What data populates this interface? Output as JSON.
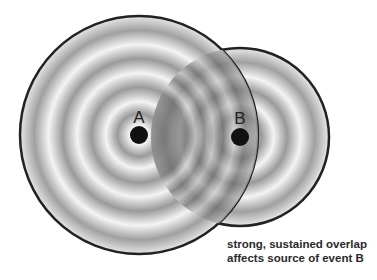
{
  "diagram": {
    "sources": [
      {
        "label": "A",
        "cx": 139,
        "cy": 135,
        "r": 119,
        "dot_r": 9
      },
      {
        "label": "B",
        "cx": 240,
        "cy": 137,
        "r": 89,
        "dot_r": 9
      }
    ],
    "caption": {
      "line1": "strong, sustained overlap",
      "line2": "affects source of event B"
    },
    "colors": {
      "outline": "#222222",
      "dot": "#111111",
      "ring_light": "#f4f4f4",
      "ring_dark": "#8c8c8c",
      "overlap_dark": "#5a5a5a"
    }
  }
}
